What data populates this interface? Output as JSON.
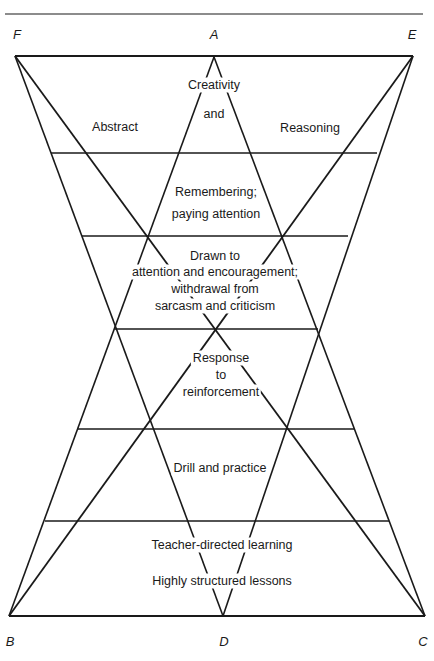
{
  "diagram": {
    "vertices": [
      {
        "id": "F",
        "label": "F",
        "x": 17,
        "y": 34
      },
      {
        "id": "A",
        "label": "A",
        "x": 214,
        "y": 34
      },
      {
        "id": "E",
        "label": "E",
        "x": 412,
        "y": 34
      },
      {
        "id": "B",
        "label": "B",
        "x": 10,
        "y": 641
      },
      {
        "id": "D",
        "label": "D",
        "x": 224,
        "y": 641
      },
      {
        "id": "C",
        "label": "C",
        "x": 423,
        "y": 641
      }
    ],
    "bands": [
      {
        "lines": [
          "Creativity",
          "and"
        ],
        "side_left": "Abstract",
        "side_right": "Reasoning"
      },
      {
        "lines": [
          "Remembering;",
          "paying attention"
        ]
      },
      {
        "lines": [
          "Drawn to",
          "attention and encouragement;",
          "withdrawal from",
          "sarcasm and criticism"
        ]
      },
      {
        "lines": [
          "Response",
          "to",
          "reinforcement"
        ]
      },
      {
        "lines": [
          "Drill and practice"
        ]
      },
      {
        "lines": [
          "Teacher-directed learning",
          "Highly structured lessons"
        ]
      }
    ],
    "line_color": "#1a1a1a"
  }
}
